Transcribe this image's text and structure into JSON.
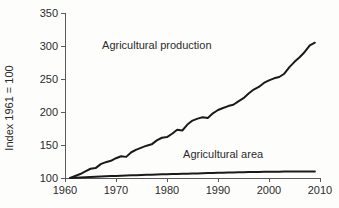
{
  "chart_data": {
    "type": "line",
    "title": "",
    "subtitle": "",
    "xlabel": "",
    "ylabel": "Index 1961 = 100",
    "xlim": [
      1960,
      2010
    ],
    "ylim": [
      100,
      350
    ],
    "grid": false,
    "legend_position": "inline-annotations",
    "xticks": [
      1960,
      1970,
      1980,
      1990,
      2000,
      2010
    ],
    "xtick_labels": [
      "1960",
      "1970",
      "1980",
      "1990",
      "2000",
      "2010"
    ],
    "yticks": [
      100,
      150,
      200,
      250,
      300,
      350
    ],
    "ytick_labels": [
      "100",
      "150",
      "200",
      "250",
      "300",
      "350"
    ],
    "x": [
      1961,
      1962,
      1963,
      1964,
      1965,
      1966,
      1967,
      1968,
      1969,
      1970,
      1971,
      1972,
      1973,
      1974,
      1975,
      1976,
      1977,
      1978,
      1979,
      1980,
      1981,
      1982,
      1983,
      1984,
      1985,
      1986,
      1987,
      1988,
      1989,
      1990,
      1991,
      1992,
      1993,
      1994,
      1995,
      1996,
      1997,
      1998,
      1999,
      2000,
      2001,
      2002,
      2003,
      2004,
      2005,
      2006,
      2007,
      2008,
      2009
    ],
    "series": [
      {
        "name": "Agricultural production",
        "color": "#1a1a1a",
        "annotation": "Agricultural production",
        "annotation_x": 1978,
        "annotation_y": 296,
        "values": [
          100,
          103,
          106,
          110,
          114,
          115,
          121,
          124,
          126,
          130,
          133,
          132,
          139,
          143,
          146,
          149,
          151,
          157,
          161,
          162,
          167,
          173,
          172,
          181,
          187,
          190,
          192,
          191,
          198,
          203,
          206,
          209,
          211,
          216,
          221,
          228,
          234,
          238,
          244,
          248,
          251,
          253,
          258,
          268,
          276,
          283,
          291,
          301,
          305
        ]
      },
      {
        "name": "Agricultural area",
        "color": "#1a1a1a",
        "annotation": "Agricultural area",
        "annotation_x": 1991,
        "annotation_y": 131,
        "values": [
          100,
          100.4,
          100.8,
          101.2,
          101.6,
          102.0,
          102.3,
          102.6,
          102.9,
          103.2,
          103.5,
          103.8,
          104.0,
          104.3,
          104.6,
          104.9,
          105.1,
          105.4,
          105.6,
          105.8,
          106.0,
          106.2,
          106.4,
          106.6,
          106.8,
          107.0,
          107.2,
          107.4,
          107.6,
          107.8,
          108.0,
          108.2,
          108.4,
          108.6,
          108.8,
          109.0,
          109.1,
          109.2,
          109.3,
          109.4,
          109.5,
          109.6,
          109.7,
          109.8,
          109.85,
          109.9,
          109.95,
          110.0,
          110.0
        ]
      }
    ]
  }
}
